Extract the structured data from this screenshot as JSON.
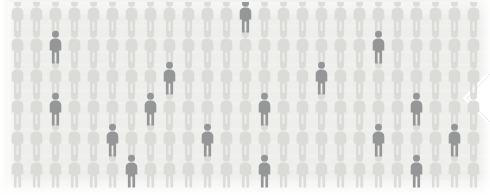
{
  "figure_icon": "person-icon",
  "colors": {
    "background": "#f2f2f0",
    "panel": "#eeeeec",
    "crowd_light": "#d7d7d3",
    "crowd_highlight": "#8f9192",
    "notch_white": "#ffffff"
  },
  "chart_data": {
    "type": "pictogram",
    "title": "",
    "subtitle": "",
    "xlabel": "",
    "ylabel": "",
    "icon": "person-icon",
    "columns": 25,
    "rows": 6,
    "icon_spacing_x": 19,
    "icon_spacing_y": 31,
    "total_icons": 150,
    "categories": [
      "unhighlighted",
      "highlighted"
    ],
    "values": [
      134,
      16
    ],
    "legend": [],
    "annotations": [],
    "highlighted_positions": [
      {
        "row": 0,
        "col": 12
      },
      {
        "row": 1,
        "col": 2
      },
      {
        "row": 1,
        "col": 19
      },
      {
        "row": 2,
        "col": 8
      },
      {
        "row": 2,
        "col": 16
      },
      {
        "row": 3,
        "col": 2
      },
      {
        "row": 3,
        "col": 7
      },
      {
        "row": 3,
        "col": 13
      },
      {
        "row": 3,
        "col": 21
      },
      {
        "row": 4,
        "col": 5
      },
      {
        "row": 4,
        "col": 10
      },
      {
        "row": 4,
        "col": 19
      },
      {
        "row": 4,
        "col": 23
      },
      {
        "row": 5,
        "col": 6
      },
      {
        "row": 5,
        "col": 13
      },
      {
        "row": 5,
        "col": 21
      }
    ]
  },
  "overlay": {
    "notch_shape": "chevron-left-notch"
  }
}
